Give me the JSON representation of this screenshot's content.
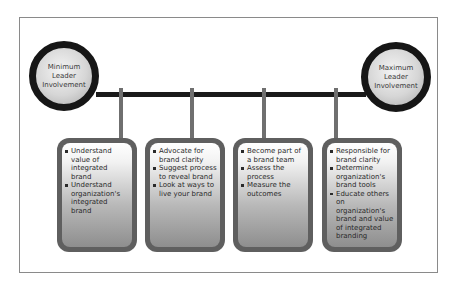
{
  "diagram": {
    "left_endpoint": {
      "label": "Minimum Leader Involvement"
    },
    "right_endpoint": {
      "label": "Maximum Leader Involvement"
    },
    "stages": [
      {
        "items": [
          "Understand value of integrated brand",
          "Understand organization's integrated brand"
        ]
      },
      {
        "items": [
          "Advocate for brand clarity",
          "Suggest process to reveal brand",
          "Look at ways to live your brand"
        ]
      },
      {
        "items": [
          "Become part of a brand team",
          "Assess the process",
          "Measure the outcomes"
        ]
      },
      {
        "items": [
          "Responsible for brand clarity",
          "Determine organization's brand tools",
          "Educate others on organization's brand and value of integrated branding"
        ]
      }
    ]
  },
  "colors": {
    "bar": "#1a1a1a",
    "connector": "#6f6f6f",
    "box_border": "#5f5f5f",
    "circle_ring": "#161616",
    "frame": "#8a8a8a"
  }
}
